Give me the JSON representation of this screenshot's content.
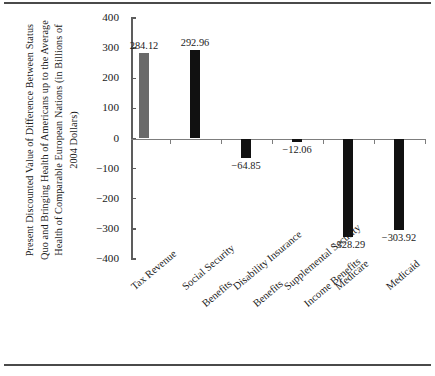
{
  "chart_data": {
    "type": "bar",
    "title": "",
    "subtitle": "",
    "xlabel": "",
    "ylabel": "Present Discounted Value of Difference Between Status Quo and Bringing Health of Americans up to the Average Health of Comparable European Nations (in Billions of 2004 Dollars)",
    "categories": [
      "Tax Revenue",
      "Social Security Benefits",
      "Disability Insurance Benefits",
      "Supplemental Security Income Benefits",
      "Medicare",
      "Medicaid"
    ],
    "category_lines": [
      [
        "Tax Revenue"
      ],
      [
        "Social Security",
        "Benefits"
      ],
      [
        "Disability Insurance",
        "Benefits"
      ],
      [
        "Supplemental Security",
        "Income Benefits"
      ],
      [
        "Medicare"
      ],
      [
        "Medicaid"
      ]
    ],
    "values": [
      284.12,
      292.96,
      -64.85,
      -12.06,
      -328.29,
      -303.92
    ],
    "value_labels": [
      "284.12",
      "292.96",
      "−64.85",
      "−12.06",
      "−328.29",
      "−303.92"
    ],
    "bar_colors": [
      "#6a6a6a",
      "#111111",
      "#111111",
      "#111111",
      "#111111",
      "#111111"
    ],
    "ylim": [
      -400,
      400
    ],
    "yticks": [
      400,
      300,
      200,
      100,
      0,
      -100,
      -200,
      -300,
      -400
    ],
    "ytick_labels": [
      "400",
      "300",
      "200",
      "100",
      "0",
      "−100",
      "−200",
      "−300",
      "−400"
    ],
    "grid": false,
    "legend": null,
    "legend_position": "none"
  }
}
